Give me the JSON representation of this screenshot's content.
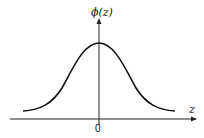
{
  "diagram": {
    "y_axis_label": "ϕ(z)",
    "x_axis_label": "z",
    "origin_label": "0",
    "colors": {
      "curve": "#111111",
      "axis": "#222222",
      "background": "#ffffff"
    }
  }
}
